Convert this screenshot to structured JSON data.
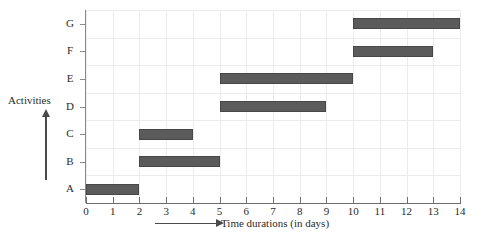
{
  "chart_data": {
    "type": "bar",
    "orientation": "horizontal",
    "subtype": "gantt",
    "title": "",
    "xlabel": "Time durations (in days)",
    "ylabel": "Activities",
    "xlim": [
      0,
      14
    ],
    "xticks": [
      "0",
      "1",
      "2",
      "3",
      "4",
      "5",
      "6",
      "7",
      "8",
      "9",
      "10",
      "11",
      "12",
      "13",
      "14"
    ],
    "categories": [
      "A",
      "B",
      "C",
      "D",
      "E",
      "F",
      "G"
    ],
    "grid": true,
    "legend": false,
    "bar_color": "#5b5b5b",
    "grid_color": "#ececec",
    "tasks": [
      {
        "activity": "G",
        "start": 10,
        "end": 14,
        "duration": 4
      },
      {
        "activity": "F",
        "start": 10,
        "end": 13,
        "duration": 3
      },
      {
        "activity": "E",
        "start": 5,
        "end": 10,
        "duration": 5
      },
      {
        "activity": "D",
        "start": 5,
        "end": 9,
        "duration": 4
      },
      {
        "activity": "C",
        "start": 2,
        "end": 4,
        "duration": 2
      },
      {
        "activity": "B",
        "start": 2,
        "end": 5,
        "duration": 3
      },
      {
        "activity": "A",
        "start": 0,
        "end": 2,
        "duration": 2
      }
    ]
  }
}
